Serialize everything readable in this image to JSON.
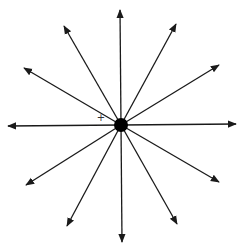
{
  "diagram": {
    "type": "radial-arrows",
    "center": {
      "x": 121,
      "y": 125,
      "radius": 7,
      "color": "#000000"
    },
    "marker": {
      "symbol": "+",
      "x": 101,
      "y": 121
    },
    "stroke_color": "#1a1a1a",
    "arrows": [
      {
        "name": "arrow-up",
        "x": 120,
        "y": 10
      },
      {
        "name": "arrow-up-right",
        "x": 176,
        "y": 24
      },
      {
        "name": "arrow-right-up",
        "x": 219,
        "y": 65
      },
      {
        "name": "arrow-right",
        "x": 236,
        "y": 124
      },
      {
        "name": "arrow-right-down",
        "x": 219,
        "y": 182
      },
      {
        "name": "arrow-down-right",
        "x": 177,
        "y": 224
      },
      {
        "name": "arrow-down",
        "x": 122,
        "y": 242
      },
      {
        "name": "arrow-down-left",
        "x": 67,
        "y": 226
      },
      {
        "name": "arrow-left-down",
        "x": 26,
        "y": 185
      },
      {
        "name": "arrow-left",
        "x": 8,
        "y": 126
      },
      {
        "name": "arrow-left-up",
        "x": 24,
        "y": 68
      },
      {
        "name": "arrow-up-left",
        "x": 64,
        "y": 26
      }
    ]
  }
}
